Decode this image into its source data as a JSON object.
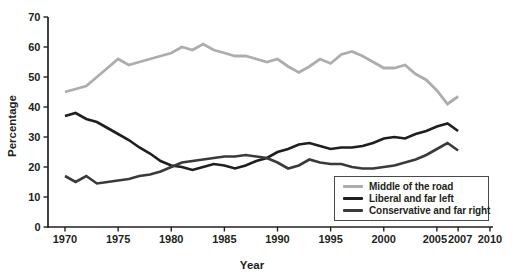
{
  "figure": {
    "background": "#ffffff",
    "text_color": "#231f20",
    "axis_color": "#231f20",
    "legend_border_color": "#4a4a4a"
  },
  "chart_data": {
    "type": "line",
    "title": "",
    "xlabel": "Year",
    "ylabel": "Percentage",
    "xlim": [
      1968.4,
      2010.3
    ],
    "ylim": [
      0,
      70
    ],
    "grid": false,
    "legend_position": "inside-bottom-right",
    "xticks": [
      1970,
      1975,
      1980,
      1985,
      1990,
      1995,
      2000,
      2005,
      2007,
      2010
    ],
    "yticks": [
      0,
      10,
      20,
      30,
      40,
      50,
      60,
      70
    ],
    "x": [
      1970,
      1971,
      1972,
      1973,
      1974,
      1975,
      1976,
      1977,
      1978,
      1979,
      1980,
      1981,
      1982,
      1983,
      1984,
      1985,
      1986,
      1987,
      1988,
      1989,
      1990,
      1991,
      1992,
      1993,
      1994,
      1995,
      1996,
      1997,
      1998,
      1999,
      2000,
      2001,
      2002,
      2003,
      2004,
      2005,
      2006,
      2007
    ],
    "series": [
      {
        "name": "Middle of the road",
        "color": "#adadad",
        "line_width": 2.8,
        "values": [
          45,
          46,
          47,
          50,
          53,
          56,
          54,
          55,
          56,
          57,
          58,
          60,
          59,
          61,
          59,
          58,
          57,
          57,
          56,
          55,
          56,
          53.5,
          51.5,
          53.5,
          56,
          54.5,
          57.5,
          58.5,
          57,
          55,
          53,
          53,
          54,
          51,
          49,
          45.5,
          41,
          43.5
        ]
      },
      {
        "name": "Liberal and far left",
        "color": "#1f1f1f",
        "line_width": 2.6,
        "values": [
          37,
          38,
          36,
          35,
          33,
          31,
          29,
          26.5,
          24.5,
          22,
          20.5,
          20,
          19,
          20,
          21,
          20.5,
          19.5,
          20.5,
          22,
          23,
          25,
          26,
          27.5,
          28,
          27,
          26,
          26.5,
          26.5,
          27,
          28,
          29.5,
          30,
          29.5,
          31,
          32,
          33.5,
          34.5,
          32
        ]
      },
      {
        "name": "Conservative and far right",
        "color": "#3a3a3a",
        "line_width": 2.6,
        "values": [
          17,
          15,
          17,
          14.5,
          15,
          15.5,
          16,
          17,
          17.5,
          18.5,
          20,
          21.5,
          22,
          22.5,
          23,
          23.5,
          23.5,
          24,
          23.5,
          23,
          21.5,
          19.5,
          20.5,
          22.5,
          21.5,
          21,
          21,
          20,
          19.5,
          19.5,
          20,
          20.5,
          21.5,
          22.5,
          24,
          26,
          28,
          25.5
        ]
      }
    ]
  }
}
